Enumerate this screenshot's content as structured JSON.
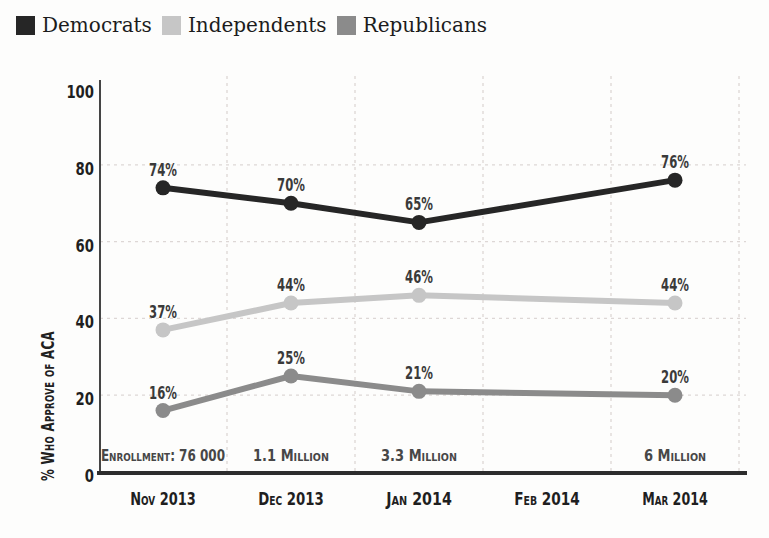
{
  "chart_data": {
    "type": "line",
    "title": "",
    "categories": [
      "Nov 2013",
      "Dec 2013",
      "Jan 2014",
      "Feb 2014",
      "Mar 2014"
    ],
    "series": [
      {
        "name": "Democrats",
        "color": "#262626",
        "values": [
          74,
          70,
          65,
          null,
          76
        ]
      },
      {
        "name": "Independents",
        "color": "#c6c6c6",
        "values": [
          37,
          44,
          46,
          null,
          44
        ]
      },
      {
        "name": "Republicans",
        "color": "#8b8b8b",
        "values": [
          16,
          25,
          21,
          null,
          20
        ]
      }
    ],
    "point_label_format": "{value}%",
    "xlabel": "",
    "ylabel": "% Who Approve of ACA",
    "ylim": [
      0,
      100
    ],
    "yticks": [
      0,
      20,
      40,
      60,
      80,
      100
    ],
    "grid": true,
    "grid_style": "dashed",
    "legend_position": "top-left",
    "annotations": [
      {
        "category": "Nov 2013",
        "text": "Enrollment: 76 000"
      },
      {
        "category": "Dec 2013",
        "text": "1.1 Million"
      },
      {
        "category": "Jan 2014",
        "text": "3.3 Million"
      },
      {
        "category": "Mar 2014",
        "text": "6 Million"
      }
    ]
  },
  "colors": {
    "background": "#fdfdfc",
    "gridline": "#ddd7d5",
    "axis": "#2d2d2d",
    "tick_text": "#1f1f1f",
    "point_label_text": "#3a3a3a",
    "annotation_text": "#474747",
    "legend_text": "#1c1c1c"
  }
}
